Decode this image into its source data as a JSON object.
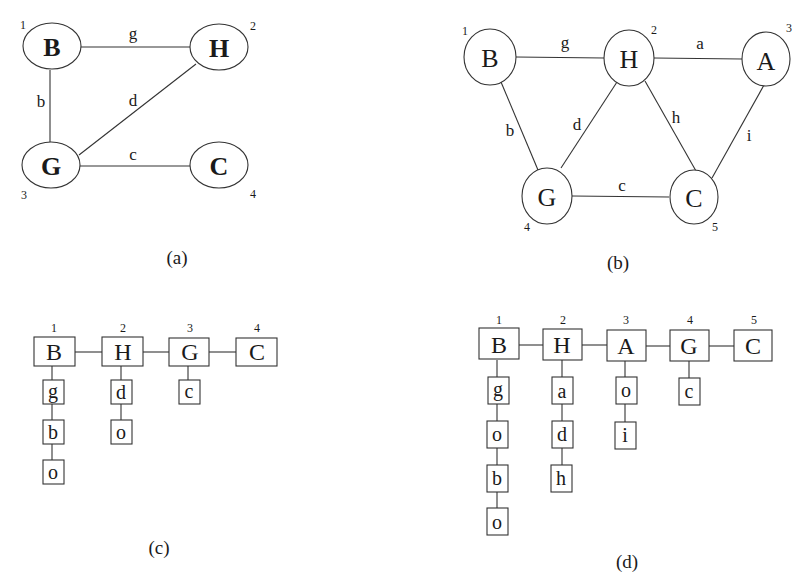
{
  "figure_a": {
    "caption": "(a)",
    "nodes": [
      {
        "id": "B",
        "label": "B",
        "num": "1"
      },
      {
        "id": "H",
        "label": "H",
        "num": "2"
      },
      {
        "id": "G",
        "label": "G",
        "num": "3"
      },
      {
        "id": "C",
        "label": "C",
        "num": "4"
      }
    ],
    "edges": [
      {
        "from": "B",
        "to": "H",
        "label": "g"
      },
      {
        "from": "B",
        "to": "G",
        "label": "b"
      },
      {
        "from": "G",
        "to": "H",
        "label": "d"
      },
      {
        "from": "G",
        "to": "C",
        "label": "c"
      }
    ]
  },
  "figure_b": {
    "caption": "(b)",
    "nodes": [
      {
        "id": "B",
        "label": "B",
        "num": "1"
      },
      {
        "id": "H",
        "label": "H",
        "num": "2"
      },
      {
        "id": "A",
        "label": "A",
        "num": "3"
      },
      {
        "id": "G",
        "label": "G",
        "num": "4"
      },
      {
        "id": "C",
        "label": "C",
        "num": "5"
      }
    ],
    "edges": [
      {
        "from": "B",
        "to": "H",
        "label": "g"
      },
      {
        "from": "H",
        "to": "A",
        "label": "a"
      },
      {
        "from": "B",
        "to": "G",
        "label": "b"
      },
      {
        "from": "G",
        "to": "H",
        "label": "d"
      },
      {
        "from": "H",
        "to": "C",
        "label": "h"
      },
      {
        "from": "A",
        "to": "C",
        "label": "i"
      },
      {
        "from": "G",
        "to": "C",
        "label": "c"
      }
    ]
  },
  "figure_c": {
    "caption": "(c)",
    "columns": [
      {
        "num": "1",
        "head": "B",
        "items": [
          "g",
          "b",
          "o"
        ]
      },
      {
        "num": "2",
        "head": "H",
        "items": [
          "d",
          "o"
        ]
      },
      {
        "num": "3",
        "head": "G",
        "items": [
          "c"
        ]
      },
      {
        "num": "4",
        "head": "C",
        "items": []
      }
    ]
  },
  "figure_d": {
    "caption": "(d)",
    "columns": [
      {
        "num": "1",
        "head": "B",
        "items": [
          "g",
          "o",
          "b",
          "o"
        ]
      },
      {
        "num": "2",
        "head": "H",
        "items": [
          "a",
          "d",
          "h"
        ]
      },
      {
        "num": "3",
        "head": "A",
        "items": [
          "o",
          "i"
        ]
      },
      {
        "num": "4",
        "head": "G",
        "items": [
          "c"
        ]
      },
      {
        "num": "5",
        "head": "C",
        "items": []
      }
    ]
  }
}
